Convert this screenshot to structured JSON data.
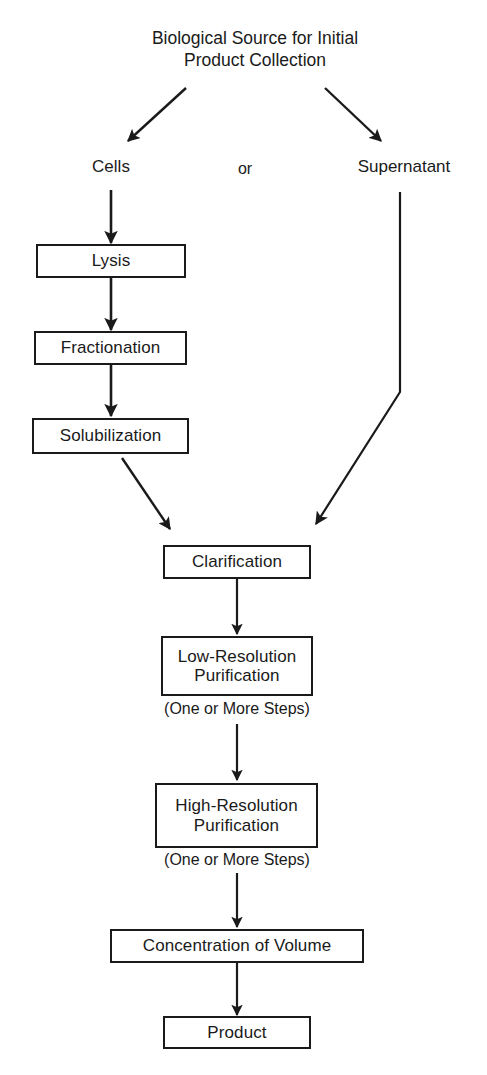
{
  "diagram": {
    "title_line1": "Biological Source for Initial",
    "title_line2": "Product Collection",
    "branch_labels": {
      "left": "Cells",
      "conjunction": "or",
      "right": "Supernatant"
    },
    "nodes": [
      {
        "id": "lysis",
        "label": "Lysis"
      },
      {
        "id": "fractionation",
        "label": "Fractionation"
      },
      {
        "id": "solubilization",
        "label": "Solubilization"
      },
      {
        "id": "clarification",
        "label": "Clarification"
      },
      {
        "id": "low-resolution-purification",
        "label_line1": "Low-Resolution",
        "label_line2": "Purification"
      },
      {
        "id": "high-resolution-purification",
        "label_line1": "High-Resolution",
        "label_line2": "Purification"
      },
      {
        "id": "concentration-of-volume",
        "label": "Concentration of Volume"
      },
      {
        "id": "product",
        "label": "Product"
      }
    ],
    "captions": {
      "low_res_steps": "(One or More Steps)",
      "high_res_steps": "(One or More Steps)"
    },
    "colors": {
      "stroke": "#1a1a1a",
      "background": "#ffffff",
      "text": "#1a1a1a"
    }
  }
}
